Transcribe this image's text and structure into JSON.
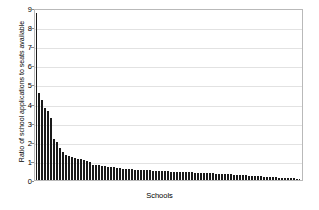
{
  "chart_data": {
    "type": "bar",
    "title": "",
    "xlabel": "Schools",
    "ylabel": "Ratio of school applications to seats available",
    "ylim": [
      0,
      9
    ],
    "yticks": [
      0,
      1,
      2,
      3,
      4,
      5,
      6,
      7,
      8,
      9
    ],
    "grid": true,
    "legend": null,
    "xtick_labels": [],
    "categories": [
      "1",
      "2",
      "3",
      "4",
      "5",
      "6",
      "7",
      "8",
      "9",
      "10",
      "11",
      "12",
      "13",
      "14",
      "15",
      "16",
      "17",
      "18",
      "19",
      "20",
      "21",
      "22",
      "23",
      "24",
      "25",
      "26",
      "27",
      "28",
      "29",
      "30",
      "31",
      "32",
      "33",
      "34",
      "35",
      "36",
      "37",
      "38",
      "39",
      "40",
      "41",
      "42",
      "43",
      "44",
      "45",
      "46",
      "47",
      "48",
      "49",
      "50",
      "51",
      "52",
      "53",
      "54",
      "55",
      "56",
      "57",
      "58",
      "59",
      "60",
      "61",
      "62",
      "63",
      "64",
      "65",
      "66",
      "67",
      "68",
      "69",
      "70",
      "71",
      "72",
      "73",
      "74",
      "75",
      "76",
      "77",
      "78",
      "79",
      "80",
      "81",
      "82",
      "83",
      "84",
      "85",
      "86",
      "87",
      "88",
      "89",
      "90"
    ],
    "values": [
      8.75,
      4.55,
      4.2,
      3.75,
      3.6,
      3.25,
      2.15,
      2.0,
      1.65,
      1.45,
      1.3,
      1.25,
      1.2,
      1.15,
      1.1,
      1.08,
      1.05,
      1.0,
      0.95,
      0.8,
      0.78,
      0.76,
      0.74,
      0.72,
      0.7,
      0.68,
      0.66,
      0.64,
      0.62,
      0.6,
      0.58,
      0.57,
      0.56,
      0.55,
      0.54,
      0.53,
      0.52,
      0.51,
      0.5,
      0.49,
      0.48,
      0.47,
      0.46,
      0.45,
      0.45,
      0.44,
      0.43,
      0.43,
      0.42,
      0.42,
      0.41,
      0.4,
      0.4,
      0.39,
      0.38,
      0.38,
      0.37,
      0.36,
      0.36,
      0.35,
      0.34,
      0.33,
      0.32,
      0.31,
      0.3,
      0.29,
      0.28,
      0.27,
      0.26,
      0.25,
      0.24,
      0.23,
      0.22,
      0.21,
      0.2,
      0.19,
      0.18,
      0.17,
      0.16,
      0.15,
      0.14,
      0.13,
      0.12,
      0.11,
      0.1,
      0.09,
      0.08,
      0.07,
      0.06,
      0.05
    ]
  },
  "style": {
    "bar_color": "#1a1a1a",
    "grid_color": "#e2e2e2",
    "frame_color": "#b9b9b9",
    "text_color": "#000000"
  }
}
